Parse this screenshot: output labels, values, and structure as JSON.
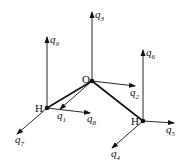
{
  "diagram": {
    "title": "",
    "atoms": [
      {
        "id": "O",
        "label": "O",
        "x": 92,
        "y": 81
      },
      {
        "id": "H1",
        "label": "H",
        "x": 47,
        "y": 108
      },
      {
        "id": "H2",
        "label": "H",
        "x": 143,
        "y": 121
      }
    ],
    "bonds": [
      [
        "O",
        "H1"
      ],
      [
        "O",
        "H2"
      ]
    ],
    "vectors": [
      {
        "name": "q1",
        "base": "q",
        "sub": "1"
      },
      {
        "name": "q2",
        "base": "q",
        "sub": "2"
      },
      {
        "name": "q3",
        "base": "q",
        "sub": "3"
      },
      {
        "name": "q4",
        "base": "q",
        "sub": "4"
      },
      {
        "name": "q5",
        "base": "q",
        "sub": "5"
      },
      {
        "name": "q6",
        "base": "q",
        "sub": "6"
      },
      {
        "name": "q7",
        "base": "q",
        "sub": "7"
      },
      {
        "name": "q8",
        "base": "q",
        "sub": "8"
      },
      {
        "name": "q9",
        "base": "q",
        "sub": "9"
      }
    ]
  }
}
